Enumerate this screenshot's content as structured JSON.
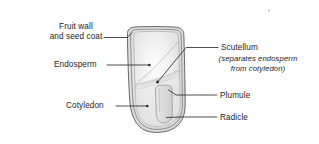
{
  "figure": {
    "type": "botanical-diagram",
    "background_color": "#ffffff",
    "line_color": "#3a3a3a",
    "text_color": "#1c1c1c"
  },
  "labels": {
    "fruit_wall_line1": "Fruit wall",
    "fruit_wall_line2": "and seed coat",
    "endosperm": "Endosperm",
    "cotyledon": "Cotyledon",
    "scutellum": "Scutellum",
    "scutellum_note_line1": "(separates endosperm",
    "scutellum_note_line2": "from cotyledon)",
    "plumule": "Plumule",
    "radicle": "Radicle"
  },
  "parts": [
    {
      "name": "fruit-wall-and-seed-coat",
      "label": "Fruit wall and seed coat",
      "side": "left"
    },
    {
      "name": "endosperm",
      "label": "Endosperm",
      "side": "left"
    },
    {
      "name": "cotyledon",
      "label": "Cotyledon",
      "side": "left"
    },
    {
      "name": "scutellum",
      "label": "Scutellum",
      "side": "right"
    },
    {
      "name": "plumule",
      "label": "Plumule",
      "side": "right"
    },
    {
      "name": "radicle",
      "label": "Radicle",
      "side": "right"
    }
  ],
  "colors": {
    "seed_fill_light": "#fbfbfb",
    "seed_fill_mid": "#e3e3e3",
    "seed_fill_edge": "#d2d2d2",
    "coat_fill": "#e8e8e8",
    "embryo_fill": "#dcdcdc",
    "outline": "#4a4a4a",
    "leader": "#2e2e2e"
  }
}
